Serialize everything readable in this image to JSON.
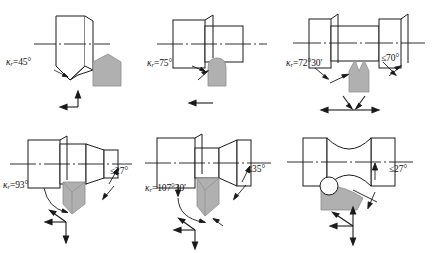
{
  "figure": {
    "type": "technical-diagram",
    "rows": 2,
    "columns": 3,
    "colors": {
      "line": "#1a1a1a",
      "insert_fill": "#a8a8a8",
      "insert_fill_light": "#c4c4c4",
      "background": "#ffffff"
    }
  },
  "cells": [
    {
      "id": "cell-1",
      "position": "top-left",
      "kappa_label": "κ",
      "kappa_sub": "r",
      "kappa_value": "=45°",
      "kappa_full": "κr=45°",
      "limit_label": "",
      "workpiece": "chamfered-end-face",
      "insert": "pointed-v",
      "arrows": [
        "left",
        "up"
      ]
    },
    {
      "id": "cell-2",
      "position": "top-middle",
      "kappa_label": "κ",
      "kappa_sub": "r",
      "kappa_value": "=75°",
      "kappa_full": "κr=75°",
      "limit_label": "",
      "workpiece": "stepped-shaft",
      "insert": "round-nose",
      "arrows": [
        "left"
      ]
    },
    {
      "id": "cell-3",
      "position": "top-right",
      "kappa_label": "κ",
      "kappa_sub": "r",
      "kappa_value": "=72°30′",
      "kappa_full": "κr=72°30′",
      "limit_label": "≤70°",
      "workpiece": "necked-grooved-shaft",
      "insert": "pointed-v-narrow",
      "arrows": [
        "left",
        "right",
        "diagonal-down-left",
        "diagonal-down-right"
      ]
    },
    {
      "id": "cell-4",
      "position": "bottom-left",
      "kappa_label": "κ",
      "kappa_sub": "r",
      "kappa_value": "=93°",
      "kappa_full": "κr=93°",
      "limit_label": "≤27°",
      "workpiece": "stepped-tapered-shaft",
      "insert": "rhombic",
      "arrows": [
        "left",
        "diagonal-up-left",
        "down"
      ]
    },
    {
      "id": "cell-5",
      "position": "bottom-middle",
      "kappa_label": "κ",
      "kappa_sub": "r",
      "kappa_value": "=107°30′",
      "kappa_full": "κr=107°30′",
      "limit_label": "≤35°",
      "workpiece": "stepped-tapered-shaft-2",
      "insert": "rhombic-2",
      "arrows": [
        "left",
        "diagonal-up-left",
        "down"
      ]
    },
    {
      "id": "cell-6",
      "position": "bottom-right",
      "kappa_label": "",
      "kappa_sub": "",
      "kappa_value": "",
      "kappa_full": "",
      "limit_label": "≤27°",
      "workpiece": "concave-curved-shaft",
      "insert": "round",
      "arrows": [
        "left",
        "diagonal-up-left",
        "up",
        "down"
      ]
    }
  ]
}
